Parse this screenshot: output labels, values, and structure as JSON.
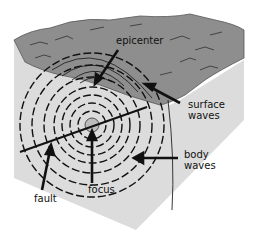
{
  "diagram": {
    "labels": {
      "epicenter": "epicenter",
      "surface_waves_1": "surface",
      "surface_waves_2": "waves",
      "body_waves_1": "body",
      "body_waves_2": "waves",
      "focus": "focus",
      "fault": "fault"
    },
    "colors": {
      "surface_top": "#8a8a8a",
      "block_side": "#d9d9d9",
      "ink": "#111111",
      "background": "#ffffff"
    }
  }
}
